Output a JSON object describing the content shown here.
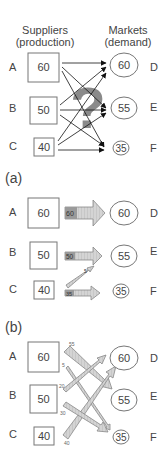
{
  "header": {
    "suppliers_line1": "Suppliers",
    "suppliers_line2": "(production)",
    "markets_line1": "Markets",
    "markets_line2": "(demand)"
  },
  "suppliers": [
    {
      "id": "A",
      "value": "60"
    },
    {
      "id": "B",
      "value": "50"
    },
    {
      "id": "C",
      "value": "40"
    }
  ],
  "markets": [
    {
      "id": "D",
      "value": "60"
    },
    {
      "id": "E",
      "value": "55"
    },
    {
      "id": "F",
      "value": "35"
    }
  ],
  "panel_top": {
    "question_mark": "?",
    "note": "All supplier-to-market links possible"
  },
  "panel_a": {
    "label": "(a)",
    "flows": [
      {
        "from": "A",
        "to": "D",
        "amount": "60"
      },
      {
        "from": "B",
        "to": "E",
        "amount": "50"
      },
      {
        "from": "C",
        "to": "E",
        "amount": "5"
      },
      {
        "from": "C",
        "to": "F",
        "amount": "35"
      }
    ]
  },
  "panel_b": {
    "label": "(b)",
    "flows": [
      {
        "from": "A",
        "to": "E",
        "amount": "55"
      },
      {
        "from": "A",
        "to": "F",
        "amount": "5"
      },
      {
        "from": "B",
        "to": "D",
        "amount": "20"
      },
      {
        "from": "B",
        "to": "F",
        "amount": "30"
      },
      {
        "from": "C",
        "to": "D",
        "amount": "40"
      }
    ]
  },
  "colors": {
    "arrow_fill": "#c8c8c8",
    "arrow_stroke": "#888888",
    "question_mark": "#8a8a8a",
    "text": "#444444"
  }
}
